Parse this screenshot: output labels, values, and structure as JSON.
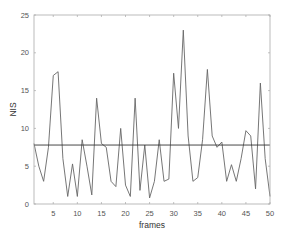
{
  "chart_data": {
    "type": "line",
    "title": "",
    "xlabel": "frames",
    "ylabel": "NIS",
    "xlim": [
      1,
      50
    ],
    "ylim": [
      0,
      25
    ],
    "grid": false,
    "legend": null,
    "x_ticks": [
      5,
      10,
      15,
      20,
      25,
      30,
      35,
      40,
      45,
      50
    ],
    "y_ticks": [
      0,
      5,
      10,
      15,
      20,
      25
    ],
    "x": [
      1,
      2,
      3,
      4,
      5,
      6,
      7,
      8,
      9,
      10,
      11,
      12,
      13,
      14,
      15,
      16,
      17,
      18,
      19,
      20,
      21,
      22,
      23,
      24,
      25,
      26,
      27,
      28,
      29,
      30,
      31,
      32,
      33,
      34,
      35,
      36,
      37,
      38,
      39,
      40,
      41,
      42,
      43,
      44,
      45,
      46,
      47,
      48,
      49,
      50
    ],
    "series": [
      {
        "name": "NIS",
        "color": "#666666",
        "values": [
          8.0,
          5.0,
          3.0,
          7.5,
          17.0,
          17.5,
          6.0,
          1.0,
          5.3,
          1.0,
          8.5,
          5.0,
          1.2,
          14.0,
          8.0,
          7.5,
          3.0,
          2.3,
          10.0,
          2.5,
          1.0,
          14.0,
          1.8,
          7.8,
          0.8,
          3.0,
          8.5,
          3.0,
          3.3,
          17.3,
          10.0,
          23.0,
          9.0,
          3.0,
          3.5,
          8.5,
          17.8,
          9.0,
          7.5,
          8.2,
          3.0,
          5.2,
          3.0,
          6.0,
          9.7,
          9.0,
          2.0,
          16.0,
          6.0,
          1.0
        ]
      }
    ],
    "reference_lines": [
      {
        "orientation": "horizontal",
        "value": 7.8,
        "color": "#333333"
      }
    ]
  },
  "labels": {
    "xlabel": "frames",
    "ylabel": "NIS"
  }
}
